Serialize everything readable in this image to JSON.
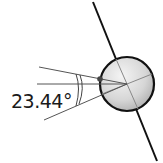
{
  "diagram": {
    "angle_label": "23.44°",
    "colors": {
      "axis": "#111111",
      "lines": "#555555",
      "globe_light": "#f2f2f2",
      "globe_dark": "#a8a8a8",
      "outline": "#111111",
      "marker": "#444444"
    }
  }
}
